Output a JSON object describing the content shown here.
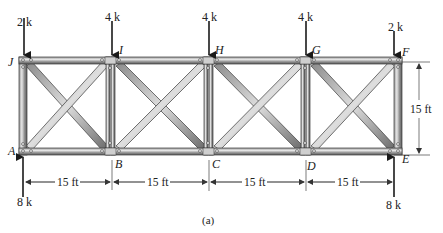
{
  "figure": {
    "caption": "(a)"
  },
  "joints": {
    "top": [
      "J",
      "I",
      "H",
      "G",
      "F"
    ],
    "bottom": [
      "A",
      "B",
      "C",
      "D",
      "E"
    ]
  },
  "loads": [
    {
      "joint": "J",
      "label": "2 k",
      "direction": "down"
    },
    {
      "joint": "I",
      "label": "4 k",
      "direction": "down"
    },
    {
      "joint": "H",
      "label": "4 k",
      "direction": "down"
    },
    {
      "joint": "G",
      "label": "4 k",
      "direction": "down"
    },
    {
      "joint": "F",
      "label": "2 k",
      "direction": "down"
    }
  ],
  "reactions": [
    {
      "joint": "A",
      "label": "8 k",
      "direction": "up"
    },
    {
      "joint": "E",
      "label": "8 k",
      "direction": "up"
    }
  ],
  "dimensions": {
    "panels": [
      "15 ft",
      "15 ft",
      "15 ft",
      "15 ft"
    ],
    "height": "15 ft"
  },
  "colors": {
    "member_light": "#d9d9d9",
    "member_dark": "#6e6e6e",
    "outline": "#3a3a3a",
    "arrow": "#1a1a1a"
  }
}
